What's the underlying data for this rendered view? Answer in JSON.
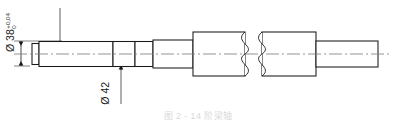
{
  "drawing": {
    "type": "stepped-shaft-technical-drawing",
    "title": "Stepped shaft part drawing",
    "line_color": "#1a1a1a",
    "center_line_color": "#808080",
    "background": "#ffffff",
    "dimensions": [
      {
        "id": "d38",
        "symbol": "Ø",
        "value": "38",
        "tolerance_upper": "+0,04",
        "tolerance_lower": "0",
        "orientation": "vertical",
        "position": "upper-left"
      },
      {
        "id": "d42",
        "symbol": "Ø",
        "value": "42",
        "tolerance_upper": "",
        "tolerance_lower": "",
        "orientation": "vertical",
        "position": "lower-middle"
      }
    ],
    "features": {
      "break_symbol": "S-curve broken view",
      "center_line": "dash-dot",
      "arrowheads": "filled solid"
    },
    "caption": "图 2 - 14   阶梁轴"
  }
}
